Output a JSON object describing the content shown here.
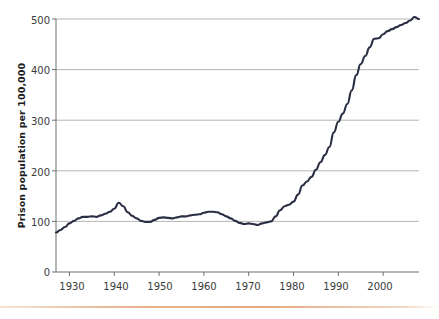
{
  "figure": {
    "background_color": "#ffffff",
    "line_color": "#2a2e42",
    "grid_color": "#b4b4b4",
    "axis_color": "#6e6e6e",
    "rule_color": "#e3a87f"
  },
  "chart_data": {
    "type": "line",
    "title": "",
    "subtitle": "",
    "xlabel": "",
    "ylabel": "Prison population per 100,000",
    "xlim": [
      1927,
      2008
    ],
    "ylim": [
      0,
      500
    ],
    "grid": "horizontal",
    "legend": "none",
    "y_ticks": [
      0,
      100,
      200,
      300,
      400,
      500
    ],
    "y_tick_labels": [
      "0",
      "100",
      "200",
      "300",
      "400",
      "500"
    ],
    "x_ticks": [
      1930,
      1940,
      1950,
      1960,
      1970,
      1980,
      1990,
      2000
    ],
    "x_tick_labels": [
      "1930",
      "1940",
      "1950",
      "1960",
      "1970",
      "1980",
      "1990",
      "2000"
    ],
    "series": [
      {
        "name": "Prison population per 100,000",
        "x": [
          1927,
          1928,
          1929,
          1930,
          1931,
          1932,
          1933,
          1934,
          1935,
          1936,
          1937,
          1938,
          1939,
          1940,
          1941,
          1942,
          1943,
          1944,
          1945,
          1946,
          1947,
          1948,
          1949,
          1950,
          1951,
          1952,
          1953,
          1954,
          1955,
          1956,
          1957,
          1958,
          1959,
          1960,
          1961,
          1962,
          1963,
          1964,
          1965,
          1966,
          1967,
          1968,
          1969,
          1970,
          1971,
          1972,
          1973,
          1974,
          1975,
          1976,
          1977,
          1978,
          1979,
          1980,
          1981,
          1982,
          1983,
          1984,
          1985,
          1986,
          1987,
          1988,
          1989,
          1990,
          1991,
          1992,
          1993,
          1994,
          1995,
          1996,
          1997,
          1998,
          1999,
          2000,
          2001,
          2002,
          2003,
          2004,
          2005,
          2006,
          2007,
          2008
        ],
        "values": [
          78,
          83,
          89,
          96,
          101,
          106,
          109,
          109,
          110,
          109,
          112,
          115,
          119,
          125,
          137,
          130,
          118,
          111,
          106,
          101,
          99,
          99,
          103,
          107,
          108,
          107,
          106,
          108,
          110,
          110,
          112,
          113,
          114,
          117,
          119,
          119,
          118,
          114,
          110,
          106,
          101,
          97,
          95,
          96,
          95,
          93,
          96,
          98,
          100,
          110,
          122,
          130,
          133,
          139,
          153,
          171,
          179,
          188,
          202,
          217,
          231,
          247,
          276,
          297,
          313,
          332,
          359,
          389,
          411,
          427,
          444,
          461,
          462,
          470,
          476,
          480,
          484,
          488,
          492,
          497,
          504,
          500
        ]
      }
    ],
    "annotations": []
  },
  "axis": {
    "y_label_text": "Prison population per 100,000"
  }
}
